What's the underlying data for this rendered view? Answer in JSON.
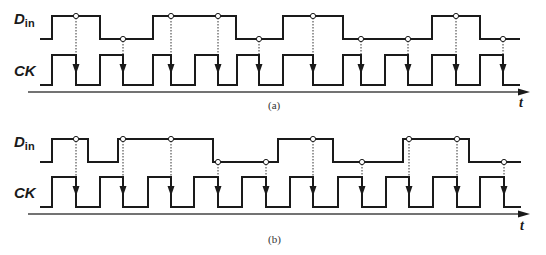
{
  "style": {
    "line_color": "#1a1a1a",
    "axis_color": "#444444",
    "dotted_color": "#333333",
    "circle_fill": "#ffffff"
  },
  "panels": [
    {
      "id": "a",
      "caption": "(a)",
      "caption_pos": [
        268,
        100
      ],
      "axis": {
        "x1": 28,
        "x2": 530,
        "y": 92,
        "label": "t",
        "label_pos": [
          519,
          96
        ]
      },
      "din": {
        "label_main": "D",
        "label_sub": "in",
        "label_pos": [
          14,
          11
        ],
        "high": 16,
        "low": 39,
        "start_x": 40,
        "end_x": 520,
        "start_level": "low",
        "transitions": [
          52,
          100,
          153,
          236,
          283,
          343,
          432,
          480
        ]
      },
      "ck": {
        "label": "CK",
        "label_pos": [
          14,
          63
        ],
        "high": 55,
        "low": 85,
        "start_x": 40,
        "end_x": 520,
        "start_level": "low",
        "transitions": [
          52,
          76,
          100,
          123,
          153,
          171,
          195,
          218,
          237,
          259,
          283,
          313,
          343,
          361,
          385,
          408,
          432,
          456,
          480,
          503
        ]
      },
      "sample_points": [
        {
          "x": 76,
          "din_level": "high"
        },
        {
          "x": 123,
          "din_level": "low"
        },
        {
          "x": 171,
          "din_level": "high"
        },
        {
          "x": 218,
          "din_level": "high"
        },
        {
          "x": 259,
          "din_level": "low"
        },
        {
          "x": 313,
          "din_level": "high"
        },
        {
          "x": 361,
          "din_level": "low"
        },
        {
          "x": 408,
          "din_level": "low"
        },
        {
          "x": 456,
          "din_level": "high"
        },
        {
          "x": 503,
          "din_level": "low"
        }
      ]
    },
    {
      "id": "b",
      "caption": "(b)",
      "caption_pos": [
        268,
        234
      ],
      "axis": {
        "x1": 28,
        "x2": 530,
        "y": 214,
        "label": "t",
        "label_pos": [
          520,
          219
        ]
      },
      "din": {
        "label_main": "D",
        "label_sub": "in",
        "label_pos": [
          14,
          134
        ],
        "high": 139,
        "low": 162,
        "start_x": 40,
        "end_x": 521,
        "start_level": "low",
        "transitions": [
          52,
          88,
          118,
          213,
          278,
          333,
          403,
          469
        ]
      },
      "ck": {
        "label": "CK",
        "label_pos": [
          14,
          185
        ],
        "high": 177,
        "low": 207,
        "start_x": 40,
        "end_x": 521,
        "start_level": "low",
        "transitions": [
          52,
          76,
          100,
          123,
          148,
          171,
          194,
          218,
          242,
          266,
          290,
          313,
          338,
          362,
          386,
          409,
          433,
          457,
          480,
          504
        ]
      },
      "sample_points": [
        {
          "x": 76,
          "din_level": "high"
        },
        {
          "x": 123,
          "din_level": "high"
        },
        {
          "x": 171,
          "din_level": "high"
        },
        {
          "x": 218,
          "din_level": "low"
        },
        {
          "x": 266,
          "din_level": "low"
        },
        {
          "x": 313,
          "din_level": "high"
        },
        {
          "x": 362,
          "din_level": "low"
        },
        {
          "x": 409,
          "din_level": "high"
        },
        {
          "x": 457,
          "din_level": "high"
        },
        {
          "x": 504,
          "din_level": "low"
        }
      ]
    }
  ]
}
